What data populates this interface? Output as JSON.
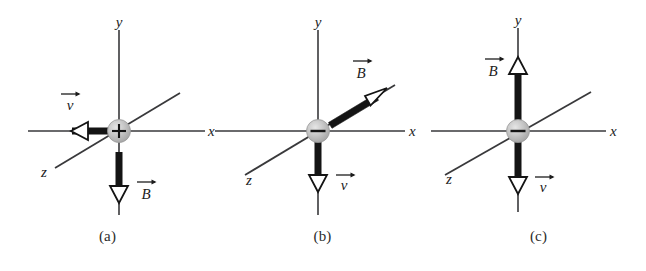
{
  "figure": {
    "type": "physics-vector-diagram",
    "background_color": "#ffffff",
    "ink_color": "#1c1c1c",
    "charge_fill_color": "#b9b9b9",
    "panels": [
      {
        "caption": "(a)",
        "charge_sign": "+",
        "charge_symbol": "+",
        "axes": [
          {
            "name": "y",
            "label": "y"
          },
          {
            "name": "x",
            "label": "x"
          },
          {
            "name": "z",
            "label": "z"
          }
        ],
        "vectors": [
          {
            "name": "velocity",
            "label": "v",
            "label_text": "v⃗",
            "direction": "-x",
            "direction_description": "points left along negative x axis",
            "style": "thick-bar-with-hollow-arrowhead"
          },
          {
            "name": "magnetic-field",
            "label": "B",
            "label_text": "B⃗",
            "direction": "-y",
            "direction_description": "points down along negative y axis",
            "style": "thick-bar-with-hollow-arrowhead"
          }
        ]
      },
      {
        "caption": "(b)",
        "charge_sign": "-",
        "charge_symbol": "−",
        "axes": [
          {
            "name": "y",
            "label": "y"
          },
          {
            "name": "x",
            "label": "x"
          },
          {
            "name": "z",
            "label": "z"
          }
        ],
        "vectors": [
          {
            "name": "magnetic-field",
            "label": "B",
            "label_text": "B⃗",
            "direction": "-z",
            "direction_description": "points up and to the right along the negative z (out of page) axis",
            "style": "thick-bar-with-hollow-arrowhead"
          },
          {
            "name": "velocity",
            "label": "v",
            "label_text": "v⃗",
            "direction": "-y",
            "direction_description": "points down along negative y axis",
            "style": "thick-bar-with-hollow-arrowhead"
          }
        ]
      },
      {
        "caption": "(c)",
        "charge_sign": "-",
        "charge_symbol": "−",
        "axes": [
          {
            "name": "y",
            "label": "y"
          },
          {
            "name": "x",
            "label": "x"
          },
          {
            "name": "z",
            "label": "z"
          }
        ],
        "vectors": [
          {
            "name": "magnetic-field",
            "label": "B",
            "label_text": "B⃗",
            "direction": "+y",
            "direction_description": "points up along positive y axis",
            "style": "thick-bar-with-hollow-arrowhead"
          },
          {
            "name": "velocity",
            "label": "v",
            "label_text": "v⃗",
            "direction": "-y",
            "direction_description": "points down along negative y axis",
            "style": "thick-bar-with-hollow-arrowhead"
          }
        ]
      }
    ]
  }
}
